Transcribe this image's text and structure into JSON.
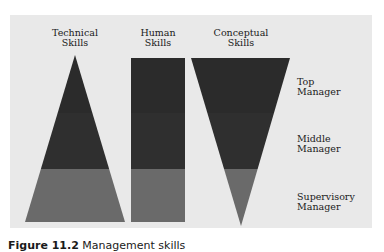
{
  "columns": [
    {
      "line1": "Technical",
      "line2": "Skills"
    },
    {
      "line1": "Human",
      "line2": "Skills"
    },
    {
      "line1": "Conceptual",
      "line2": "Skills"
    }
  ],
  "levels": [
    {
      "line1": "Top",
      "line2": "Manager"
    },
    {
      "line1": "Middle",
      "line2": "Manager"
    },
    {
      "line1": "Supervisory",
      "line2": "Manager"
    }
  ],
  "caption": {
    "label": "Figure 11.2",
    "text": "Management skills"
  },
  "colors": {
    "panel": "#e9e9e9",
    "top_band": "#2b2b2b",
    "middle_band": "#2f2f2f",
    "bottom_band": "#6a6a6a"
  }
}
